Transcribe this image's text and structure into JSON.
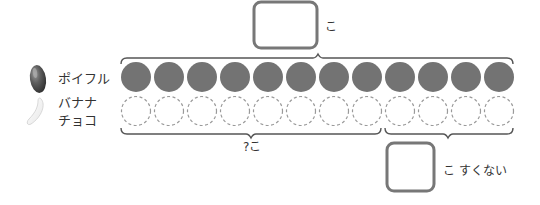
{
  "legend": {
    "items": [
      {
        "name": "poiful",
        "label": "ポイフル",
        "icon": "dark-bean-icon",
        "color": "#5a5a5a"
      },
      {
        "name": "banana-choco",
        "label_line1": "バナナ",
        "label_line2": "チョコ",
        "icon": "white-bean-icon",
        "color": "#f2f2f2"
      }
    ]
  },
  "rows": {
    "poiful": {
      "count": 12,
      "style": "filled",
      "fill": "#737373"
    },
    "banana_choco": {
      "count": 12,
      "style": "dashed",
      "stroke": "#9a9a9a"
    }
  },
  "top_answer": {
    "box_value": "",
    "unit": "こ"
  },
  "bottom_left": {
    "label": "?こ"
  },
  "bottom_right": {
    "box_value": "",
    "unit_text": "こ すくない"
  },
  "colors": {
    "brace": "#555555",
    "box_stroke": "#777777",
    "text": "#333333"
  }
}
